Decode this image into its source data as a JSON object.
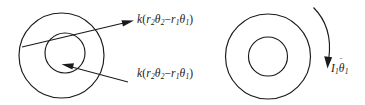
{
  "figure": {
    "background_color": "#ffffff",
    "stroke_color": "#1a1a1a",
    "left_assembly": {
      "name": "outer disk with offset inner disk",
      "outer_disk": {
        "cx": 61.5,
        "cy": 55.5,
        "r": 42.5
      },
      "inner_disk": {
        "cx": 65.0,
        "cy": 53.0,
        "r": 20.0
      }
    },
    "right_assembly": {
      "name": "concentric annular disk",
      "outer_disk": {
        "cx": 268.0,
        "cy": 56.5,
        "r": 42.5
      },
      "inner_disk": {
        "cx": 268.0,
        "cy": 56.5,
        "r": 19.5
      }
    }
  },
  "labels": {
    "force_top": {
      "id": "spring-force-upper",
      "k": "k",
      "open_paren": "(",
      "term1_symbol": "r",
      "term1_sub": "2",
      "term1_theta": "θ",
      "term1_theta_sub": "2",
      "operator": "−",
      "term2_symbol": "r",
      "term2_sub": "1",
      "term2_theta": "θ",
      "term2_theta_sub": "1",
      "close_paren": ")",
      "plain_text": "k(r2θ2 − r1θ1)"
    },
    "force_bottom": {
      "id": "spring-force-lower",
      "k": "k",
      "open_paren": "(",
      "term1_symbol": "r",
      "term1_sub": "2",
      "term1_theta": "θ",
      "term1_theta_sub": "2",
      "operator": "−",
      "term2_symbol": "r",
      "term2_sub": "1",
      "term2_theta": "θ",
      "term2_theta_sub": "1",
      "close_paren": ")",
      "plain_text": "k(r2θ2 − r1θ1)"
    },
    "torque": {
      "id": "inertia-angular-acceleration",
      "inertia_symbol": "I",
      "inertia_sub": "1",
      "theta_symbol": "θ",
      "theta_accent": "¨",
      "theta_sub": "1",
      "plain_text": "I1θ̈1"
    }
  },
  "annotations": {
    "arrow_top": {
      "name": "upper-force-arrow",
      "direction": "right"
    },
    "arrow_bottom": {
      "name": "lower-force-arrow",
      "direction": "left"
    },
    "arrow_curved": {
      "name": "angular-acceleration-arrow",
      "direction": "clockwise-down"
    }
  }
}
